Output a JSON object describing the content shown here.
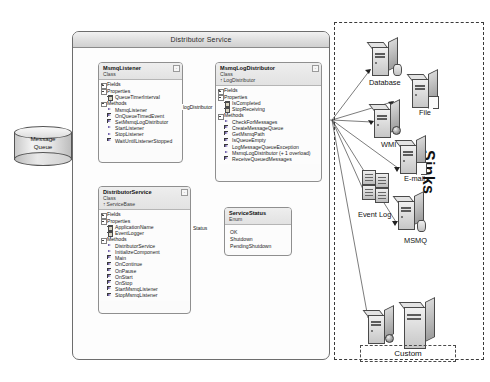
{
  "diagram": {
    "title": "Distributor Service",
    "service_panel": {
      "title": "Distributor Service"
    },
    "message_queue": {
      "line1": "Message",
      "line2": "Queue"
    },
    "sinks_panel": {
      "label": "Sinks",
      "custom_label": "Custom"
    }
  },
  "classes": {
    "msmq_listener": {
      "name": "MsmqListener",
      "stereotype": "Class",
      "collapse": "-",
      "sections": {
        "fields": "Fields",
        "properties": "Properties",
        "methods": "Methods"
      },
      "properties": [
        "QueueTimerInterval"
      ],
      "methods": [
        "MsmqListener",
        "OnQueueTimedEvent",
        "SetMsmqLogDistributor",
        "StartListener",
        "StopListener",
        "WaitUntilListenerStopped"
      ]
    },
    "msmq_log_distributor": {
      "name": "MsmqLogDistributor",
      "stereotype": "Class",
      "base": "LogDistributor",
      "collapse": "-",
      "sections": {
        "fields": "Fields",
        "properties": "Properties",
        "methods": "Methods"
      },
      "properties": [
        "IsCompleted",
        "StopReceiving"
      ],
      "methods": [
        "CheckForMessages",
        "CreateMessageQueue",
        "GetMsmqPath",
        "IsQueueEmpty",
        "LogMessageQueueException",
        "MsmqLogDistributor (+ 1 overload)",
        "ReceiveQueuedMessages"
      ]
    },
    "distributor_service": {
      "name": "DistributorService",
      "stereotype": "Class",
      "base": "ServiceBase",
      "collapse": "-",
      "sections": {
        "fields": "Fields",
        "properties": "Properties",
        "methods": "Methods"
      },
      "properties": [
        "ApplicationName",
        "EventLogger"
      ],
      "methods": [
        "DistributorService",
        "InitializeComponent",
        "Main",
        "OnContinue",
        "OnPause",
        "OnStart",
        "OnStop",
        "StartMsmqListener",
        "StopMsmqListener"
      ]
    },
    "service_status": {
      "name": "ServiceStatus",
      "stereotype": "Enum",
      "members": [
        "OK",
        "Shutdown",
        "PendingShutdown"
      ]
    }
  },
  "edges": {
    "log_distributor": "logDistributor",
    "status": "Status"
  },
  "sinks": [
    {
      "id": "database",
      "label": "Database"
    },
    {
      "id": "file",
      "label": "File"
    },
    {
      "id": "wmi",
      "label": "WMI"
    },
    {
      "id": "email",
      "label": "E-mail"
    },
    {
      "id": "event-log",
      "label": "Event Log"
    },
    {
      "id": "msmq",
      "label": "MSMQ"
    }
  ],
  "colors": {
    "panel_border": "#6d6d6d",
    "class_border": "#8f8f8f",
    "dashed": "#3a3a3a",
    "method_glyph": "#5c4a9e",
    "property_glyph": "#d8d3c0"
  }
}
